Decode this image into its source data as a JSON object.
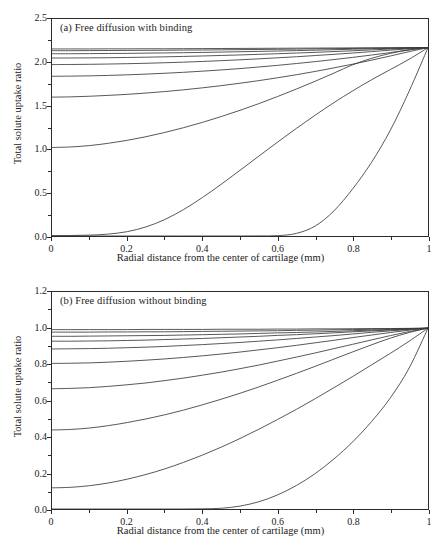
{
  "figure": {
    "background": "#ffffff",
    "line_color": "#3a3a3a",
    "axis_color": "#2b2b2b"
  },
  "chart_data": [
    {
      "type": "line",
      "panel": "a",
      "title": "(a) Free diffusion with binding",
      "xlabel": "Radial distance from the center of cartilage (mm)",
      "ylabel": "Total solute uptake ratio",
      "xlim": [
        0,
        1
      ],
      "ylim": [
        0,
        2.5
      ],
      "xticks": [
        0,
        0.2,
        0.4,
        0.6,
        0.8,
        1
      ],
      "xticklabels": [
        "0",
        "0.2",
        "0.4",
        "0.6",
        "0.8",
        "1"
      ],
      "yticks": [
        0.0,
        0.5,
        1.0,
        1.5,
        2.0,
        2.5
      ],
      "yticklabels": [
        "0.0",
        "0.5",
        "1.0",
        "1.5",
        "2.0",
        "2.5"
      ],
      "grid": false,
      "legend": "none",
      "x": [
        0,
        0.05,
        0.1,
        0.15,
        0.2,
        0.25,
        0.3,
        0.35,
        0.4,
        0.45,
        0.5,
        0.55,
        0.6,
        0.65,
        0.7,
        0.75,
        0.8,
        0.85,
        0.9,
        0.95,
        1
      ],
      "series": [
        {
          "name": "t10",
          "values": [
            2.155,
            2.155,
            2.155,
            2.156,
            2.156,
            2.157,
            2.157,
            2.158,
            2.159,
            2.16,
            2.161,
            2.162,
            2.163,
            2.164,
            2.165,
            2.166,
            2.167,
            2.168,
            2.169,
            2.17,
            2.17
          ]
        },
        {
          "name": "t9",
          "values": [
            2.135,
            2.135,
            2.136,
            2.137,
            2.138,
            2.139,
            2.14,
            2.142,
            2.143,
            2.145,
            2.147,
            2.149,
            2.151,
            2.153,
            2.156,
            2.158,
            2.161,
            2.164,
            2.166,
            2.168,
            2.17
          ]
        },
        {
          "name": "t8",
          "values": [
            2.1,
            2.1,
            2.101,
            2.103,
            2.104,
            2.107,
            2.109,
            2.112,
            2.115,
            2.119,
            2.123,
            2.127,
            2.131,
            2.136,
            2.141,
            2.146,
            2.152,
            2.157,
            2.162,
            2.167,
            2.17
          ]
        },
        {
          "name": "t7",
          "values": [
            2.05,
            2.051,
            2.052,
            2.054,
            2.057,
            2.06,
            2.064,
            2.069,
            2.074,
            2.08,
            2.086,
            2.093,
            2.1,
            2.108,
            2.116,
            2.125,
            2.134,
            2.144,
            2.154,
            2.163,
            2.17
          ]
        },
        {
          "name": "t6",
          "values": [
            1.975,
            1.976,
            1.978,
            1.981,
            1.985,
            1.99,
            1.996,
            2.003,
            2.011,
            2.02,
            2.03,
            2.041,
            2.053,
            2.065,
            2.079,
            2.093,
            2.108,
            2.124,
            2.141,
            2.157,
            2.17
          ]
        },
        {
          "name": "t5",
          "values": [
            1.84,
            1.842,
            1.845,
            1.85,
            1.857,
            1.865,
            1.875,
            1.886,
            1.899,
            1.913,
            1.929,
            1.947,
            1.966,
            1.987,
            2.009,
            2.033,
            2.058,
            2.085,
            2.113,
            2.143,
            2.17
          ]
        },
        {
          "name": "t4",
          "values": [
            1.6,
            1.603,
            1.61,
            1.62,
            1.632,
            1.647,
            1.664,
            1.684,
            1.707,
            1.732,
            1.76,
            1.79,
            1.823,
            1.858,
            1.896,
            1.937,
            1.98,
            2.026,
            2.074,
            2.124,
            2.17
          ]
        },
        {
          "name": "t3",
          "values": [
            1.02,
            1.026,
            1.042,
            1.068,
            1.102,
            1.144,
            1.193,
            1.248,
            1.309,
            1.376,
            1.448,
            1.525,
            1.607,
            1.693,
            1.783,
            1.877,
            1.973,
            2.047,
            2.104,
            2.146,
            2.17
          ]
        },
        {
          "name": "t2",
          "values": [
            0.005,
            0.006,
            0.01,
            0.022,
            0.05,
            0.105,
            0.19,
            0.305,
            0.443,
            0.596,
            0.757,
            0.92,
            1.082,
            1.24,
            1.392,
            1.537,
            1.673,
            1.8,
            1.918,
            2.037,
            2.17
          ]
        },
        {
          "name": "t1",
          "values": [
            0.0,
            0.0,
            0.0,
            0.0,
            0.0,
            0.0,
            0.0,
            0.0,
            0.0,
            0.0,
            0.0,
            0.001,
            0.004,
            0.03,
            0.115,
            0.29,
            0.545,
            0.85,
            1.22,
            1.67,
            2.17
          ]
        }
      ]
    },
    {
      "type": "line",
      "panel": "b",
      "title": "(b) Free diffusion without binding",
      "xlabel": "Radial distance from the center of cartilage (mm)",
      "ylabel": "Total solute uptake ratio",
      "xlim": [
        0,
        1
      ],
      "ylim": [
        0,
        1.2
      ],
      "xticks": [
        0,
        0.2,
        0.4,
        0.6,
        0.8,
        1
      ],
      "xticklabels": [
        "0",
        "0.2",
        "0.4",
        "0.6",
        "0.8",
        "1"
      ],
      "yticks": [
        0.0,
        0.2,
        0.4,
        0.6,
        0.8,
        1.0,
        1.2
      ],
      "yticklabels": [
        "0.0",
        "0.2",
        "0.4",
        "0.6",
        "0.8",
        "1.0",
        "1.2"
      ],
      "grid": false,
      "legend": "none",
      "x": [
        0,
        0.05,
        0.1,
        0.15,
        0.2,
        0.25,
        0.3,
        0.35,
        0.4,
        0.45,
        0.5,
        0.55,
        0.6,
        0.65,
        0.7,
        0.75,
        0.8,
        0.85,
        0.9,
        0.95,
        1
      ],
      "series": [
        {
          "name": "t10",
          "values": [
            0.992,
            0.992,
            0.992,
            0.992,
            0.992,
            0.993,
            0.993,
            0.993,
            0.993,
            0.994,
            0.994,
            0.994,
            0.995,
            0.995,
            0.996,
            0.996,
            0.997,
            0.998,
            0.998,
            0.999,
            1.0
          ]
        },
        {
          "name": "t9",
          "values": [
            0.978,
            0.978,
            0.978,
            0.979,
            0.979,
            0.98,
            0.98,
            0.981,
            0.982,
            0.983,
            0.984,
            0.985,
            0.986,
            0.988,
            0.989,
            0.991,
            0.992,
            0.994,
            0.996,
            0.998,
            1.0
          ]
        },
        {
          "name": "t8",
          "values": [
            0.955,
            0.955,
            0.956,
            0.957,
            0.958,
            0.959,
            0.96,
            0.962,
            0.964,
            0.966,
            0.968,
            0.971,
            0.974,
            0.976,
            0.979,
            0.982,
            0.986,
            0.989,
            0.993,
            0.996,
            1.0
          ]
        },
        {
          "name": "t7",
          "values": [
            0.928,
            0.928,
            0.929,
            0.93,
            0.932,
            0.934,
            0.937,
            0.94,
            0.943,
            0.947,
            0.951,
            0.955,
            0.96,
            0.964,
            0.969,
            0.974,
            0.98,
            0.985,
            0.99,
            0.995,
            1.0
          ]
        },
        {
          "name": "t6",
          "values": [
            0.885,
            0.886,
            0.887,
            0.889,
            0.892,
            0.895,
            0.899,
            0.904,
            0.909,
            0.915,
            0.921,
            0.928,
            0.935,
            0.943,
            0.951,
            0.959,
            0.968,
            0.977,
            0.985,
            0.993,
            1.0
          ]
        },
        {
          "name": "t5",
          "values": [
            0.805,
            0.806,
            0.808,
            0.812,
            0.817,
            0.823,
            0.83,
            0.838,
            0.847,
            0.857,
            0.868,
            0.88,
            0.892,
            0.905,
            0.919,
            0.933,
            0.948,
            0.962,
            0.976,
            0.989,
            1.0
          ]
        },
        {
          "name": "t4",
          "values": [
            0.665,
            0.667,
            0.671,
            0.678,
            0.687,
            0.697,
            0.71,
            0.724,
            0.74,
            0.757,
            0.776,
            0.796,
            0.818,
            0.84,
            0.863,
            0.887,
            0.911,
            0.935,
            0.959,
            0.981,
            1.0
          ]
        },
        {
          "name": "t3",
          "values": [
            0.437,
            0.44,
            0.448,
            0.461,
            0.478,
            0.498,
            0.521,
            0.547,
            0.576,
            0.607,
            0.64,
            0.675,
            0.712,
            0.75,
            0.789,
            0.829,
            0.869,
            0.908,
            0.945,
            0.976,
            1.0
          ]
        },
        {
          "name": "t2",
          "values": [
            0.117,
            0.12,
            0.129,
            0.144,
            0.165,
            0.191,
            0.222,
            0.258,
            0.298,
            0.342,
            0.39,
            0.441,
            0.495,
            0.551,
            0.61,
            0.671,
            0.733,
            0.797,
            0.861,
            0.928,
            1.0
          ]
        },
        {
          "name": "t1",
          "values": [
            0.0,
            0.0,
            0.0,
            0.0,
            0.0,
            0.0,
            0.0,
            0.0,
            0.001,
            0.004,
            0.016,
            0.04,
            0.078,
            0.13,
            0.196,
            0.277,
            0.372,
            0.484,
            0.615,
            0.78,
            1.0
          ]
        }
      ]
    }
  ]
}
